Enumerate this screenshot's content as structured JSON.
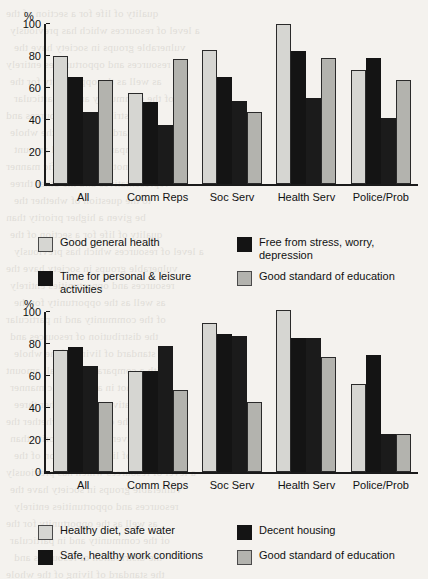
{
  "page": {
    "background_color": "#f4f2ee",
    "bleed_lines": [
      "quality of life for a section of the",
      "a level of resources which has previously",
      "vulnerable groups in society have the",
      "resources and opportunities entirely",
      "as well as the opportunity for the",
      "of the community and in particular",
      "the distribution of resources and",
      "the standard of living of the whole",
      "with a comparatively small amount",
      "and not in any specific manner",
      "representatives and the other three",
      "to the question of whether the",
      "be given a higher priority than"
    ]
  },
  "charts": [
    {
      "id": "chart-top",
      "chart_data": {
        "type": "bar",
        "title": "",
        "xlabel": "",
        "ylabel": "%",
        "ylim": [
          0,
          100
        ],
        "yticks": [
          100,
          80,
          60,
          40,
          20,
          0
        ],
        "grid": false,
        "legend_position": "bottom",
        "categories": [
          "All",
          "Comm Reps",
          "Soc Serv",
          "Health Serv",
          "Police/Prob"
        ],
        "series": [
          {
            "name": "Good general health",
            "color": "#d6d6d2",
            "values": [
              80,
              57,
              84,
              100,
              71
            ]
          },
          {
            "name": "Time for personal & leisure activities",
            "color": "#141414",
            "values": [
              67,
              51,
              67,
              83,
              79
            ]
          },
          {
            "name": "Free from stress, worry, depression",
            "color": "#1b1b1b",
            "values": [
              45,
              37,
              52,
              54,
              41
            ]
          },
          {
            "name": "Good standard of education",
            "color": "#b3b3ae",
            "values": [
              65,
              78,
              45,
              79,
              65
            ]
          }
        ]
      },
      "legend": [
        {
          "label": "Good general health",
          "swatch": "c0"
        },
        {
          "label": "Free from stress, worry, depression",
          "swatch": "c1"
        },
        {
          "label": "Time for personal & leisure activities",
          "swatch": "c1"
        },
        {
          "label": "Good standard of education",
          "swatch": "c3"
        }
      ]
    },
    {
      "id": "chart-bottom",
      "chart_data": {
        "type": "bar",
        "title": "",
        "xlabel": "",
        "ylabel": "%",
        "ylim": [
          0,
          100
        ],
        "yticks": [
          100,
          80,
          60,
          40,
          20,
          0
        ],
        "grid": false,
        "legend_position": "bottom",
        "categories": [
          "All",
          "Comm Reps",
          "Soc Serv",
          "Health Serv",
          "Police/Prob"
        ],
        "series": [
          {
            "name": "Healthy diet, safe water",
            "color": "#d6d6d2",
            "values": [
              76,
              63,
              93,
              101,
              55
            ]
          },
          {
            "name": "Safe, healthy work conditions",
            "color": "#141414",
            "values": [
              78,
              63,
              86,
              84,
              73
            ]
          },
          {
            "name": "Decent housing",
            "color": "#1b1b1b",
            "values": [
              66,
              79,
              85,
              84,
              24
            ]
          },
          {
            "name": "Good standard of education",
            "color": "#b3b3ae",
            "values": [
              44,
              51,
              44,
              72,
              24
            ]
          }
        ]
      },
      "legend": [
        {
          "label": "Healthy diet, safe water",
          "swatch": "c0"
        },
        {
          "label": "Decent housing",
          "swatch": "c1"
        },
        {
          "label": "Safe, healthy work conditions",
          "swatch": "c1"
        },
        {
          "label": "Good standard of education",
          "swatch": "c3"
        }
      ]
    }
  ]
}
